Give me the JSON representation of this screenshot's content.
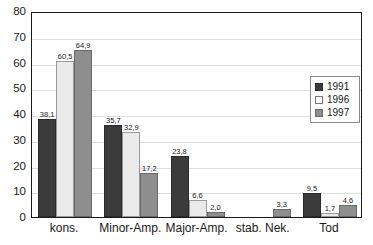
{
  "chart_data": {
    "type": "bar",
    "title": "",
    "subtitle": "",
    "xlabel": "",
    "ylabel": "",
    "ylim": [
      0,
      80
    ],
    "ytick_step": 10,
    "yticks": [
      "0",
      "10",
      "20",
      "30",
      "40",
      "50",
      "60",
      "70",
      "80"
    ],
    "grid": true,
    "legend_position": "right-inside",
    "decimal_separator": ",",
    "categories": [
      "kons.",
      "Minor-Amp.",
      "Major-Amp.",
      "stab. Nek.",
      "Tod"
    ],
    "series": [
      {
        "name": "1991",
        "color": "#3b3b3b",
        "values": [
          38.1,
          35.7,
          23.8,
          null,
          9.5
        ],
        "labels": [
          "38,1",
          "35,7",
          "23,8",
          "",
          "9,5"
        ]
      },
      {
        "name": "1996",
        "color": "#eaeaea",
        "values": [
          60.5,
          32.9,
          6.6,
          null,
          1.7
        ],
        "labels": [
          "60,5",
          "32,9",
          "6,6",
          "",
          "1,7"
        ]
      },
      {
        "name": "1997",
        "color": "#8e8e8e",
        "values": [
          64.9,
          17.2,
          2.0,
          3.3,
          4.6
        ],
        "labels": [
          "64,9",
          "17,2",
          "2,0",
          "3,3",
          "4,6"
        ]
      }
    ]
  },
  "legend": {
    "items": [
      {
        "label": "1991",
        "swatch": "s1991"
      },
      {
        "label": "1996",
        "swatch": "s1996"
      },
      {
        "label": "1997",
        "swatch": "s1997"
      }
    ]
  }
}
